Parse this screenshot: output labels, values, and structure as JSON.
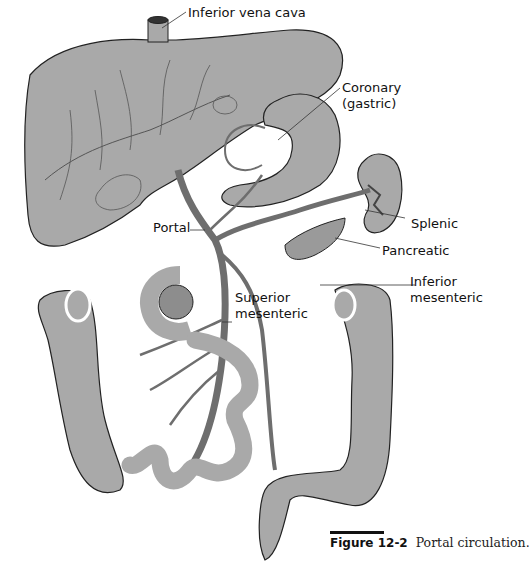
{
  "figure": {
    "caption_number": "Figure 12-2",
    "caption_text": "Portal circulation.",
    "colors": {
      "organ_fill": "#a9a9a9",
      "vein": "#6e6e6e",
      "outline": "#222222",
      "background": "#ffffff"
    },
    "labels": {
      "ivc": "Inferior vena cava",
      "coronary_1": "Coronary",
      "coronary_2": "(gastric)",
      "splenic": "Splenic",
      "pancreatic": "Pancreatic",
      "portal": "Portal",
      "inf_mes_1": "Inferior",
      "inf_mes_2": "mesenteric",
      "sup_mes_1": "Superior",
      "sup_mes_2": "mesenteric"
    }
  }
}
